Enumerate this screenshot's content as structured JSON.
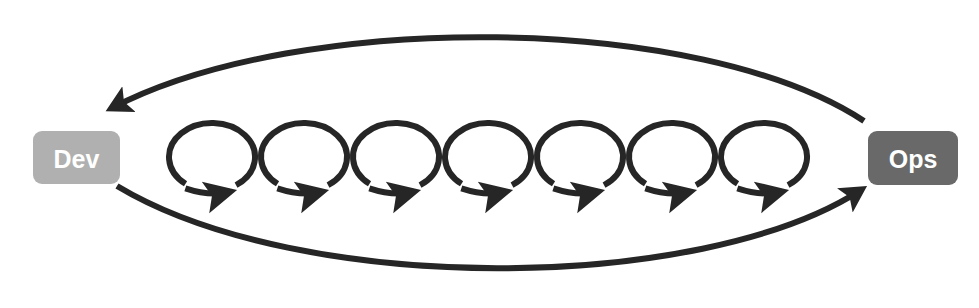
{
  "diagram": {
    "type": "cycle-diagram",
    "canvas": {
      "width": 979,
      "height": 308,
      "background": "#ffffff"
    },
    "stroke_color": "#262626",
    "nodes": [
      {
        "id": "dev",
        "label": "Dev",
        "name": "dev-node",
        "fill": "#b0b0b0",
        "text_color": "#ffffff",
        "x": 33,
        "y": 131,
        "width": 87,
        "height": 53,
        "corner_radius": 9
      },
      {
        "id": "ops",
        "label": "Ops",
        "name": "ops-node",
        "fill": "#696969",
        "text_color": "#ffffff",
        "x": 868,
        "y": 131,
        "width": 90,
        "height": 54,
        "corner_radius": 9
      }
    ],
    "arcs": [
      {
        "id": "ops-to-dev",
        "name": "ops-to-dev-arc",
        "direction": "right-to-left",
        "from": "ops",
        "to": "dev",
        "path": "M 864 121 C 700 13 300 10 112 108",
        "stroke_width": 6,
        "arrowhead": "at-dev-end"
      },
      {
        "id": "dev-to-ops",
        "name": "dev-to-ops-arc",
        "direction": "left-to-right",
        "from": "dev",
        "to": "ops",
        "path": "M 117 186 C 300 296 700 294 861 190",
        "stroke_width": 6,
        "arrowhead": "at-ops-end"
      }
    ],
    "loop_chain": {
      "name": "loop-chain",
      "count": 7,
      "first_center_x": 212,
      "spacing": 92,
      "center_y": 157,
      "radius_x": 43,
      "radius_y": 34,
      "stroke_width": 6,
      "arrow_direction": "clockwise-right"
    }
  }
}
